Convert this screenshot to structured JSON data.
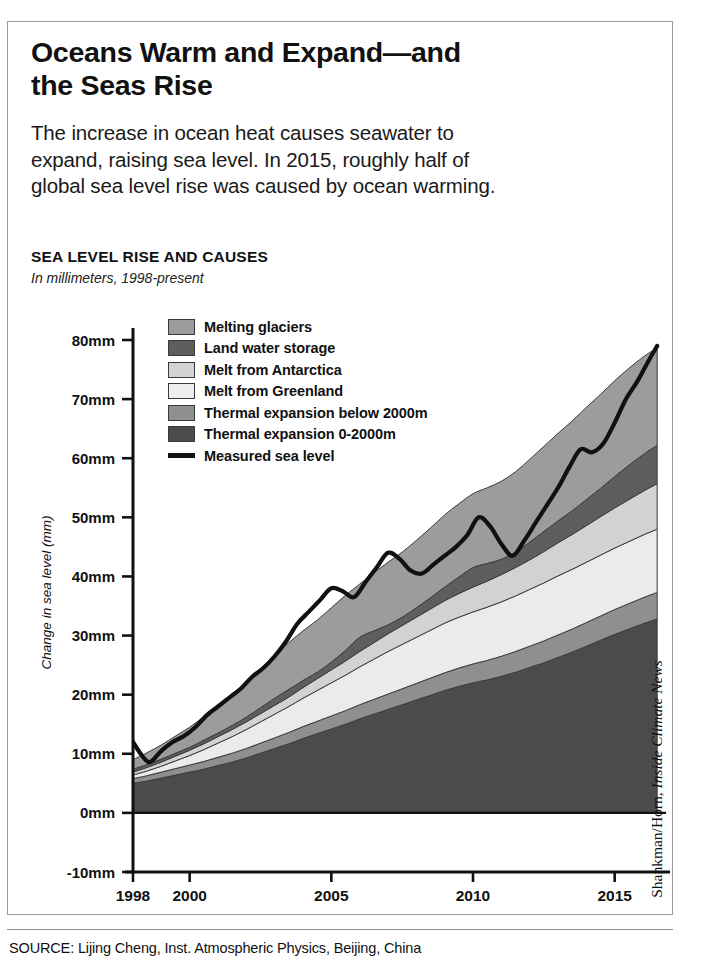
{
  "headline": "Oceans Warm and Expand—and the Seas Rise",
  "deck": "The increase in ocean heat causes seawater to expand, raising sea level. In 2015, roughly half of global sea level rise was caused by ocean warming.",
  "chart_kicker": "SEA LEVEL RISE AND CAUSES",
  "chart_subtitle": "In millimeters, 1998-present",
  "source": "SOURCE: Lijing Cheng, Inst. Atmospheric Physics, Beijing, China",
  "credit": "Shankman/Horn, ",
  "credit_italic": "Inside Climate News",
  "chart_data": {
    "type": "area",
    "title": "SEA LEVEL RISE AND CAUSES",
    "subtitle": "In millimeters, 1998-present",
    "xlabel": "",
    "ylabel": "Change in sea level (mm)",
    "ylim": [
      -10,
      85
    ],
    "xlim": [
      1998,
      2016.6
    ],
    "grid": false,
    "legend_position": "inside-top-left",
    "stacked": true,
    "y_ticks": [
      -10,
      0,
      10,
      20,
      30,
      40,
      50,
      60,
      70,
      80
    ],
    "y_tick_labels": [
      "-10mm",
      "0mm",
      "10mm",
      "20mm",
      "30mm",
      "40mm",
      "50mm",
      "60mm",
      "70mm",
      "80mm"
    ],
    "x_ticks": [
      1998,
      2000,
      2005,
      2010,
      2015
    ],
    "x_tick_labels": [
      "1998",
      "2000",
      "2005",
      "2010",
      "2015"
    ],
    "x": [
      1998.0,
      1998.5,
      1999.0,
      1999.5,
      2000.0,
      2000.5,
      2001.0,
      2001.5,
      2002.0,
      2002.5,
      2003.0,
      2003.5,
      2004.0,
      2004.5,
      2005.0,
      2005.5,
      2006.0,
      2006.5,
      2007.0,
      2007.5,
      2008.0,
      2008.5,
      2009.0,
      2009.5,
      2010.0,
      2010.5,
      2011.0,
      2011.5,
      2012.0,
      2012.5,
      2013.0,
      2013.5,
      2014.0,
      2014.5,
      2015.0,
      2015.5,
      2016.0,
      2016.5
    ],
    "series": [
      {
        "name": "Thermal expansion 0-2000m",
        "color": "#4b4b4b",
        "legend_color": "#4b4b4b",
        "values": [
          5.0,
          5.4,
          5.9,
          6.4,
          6.9,
          7.4,
          8.0,
          8.6,
          9.3,
          10.1,
          10.9,
          11.7,
          12.6,
          13.4,
          14.2,
          15.0,
          15.9,
          16.7,
          17.5,
          18.3,
          19.1,
          19.9,
          20.7,
          21.4,
          22.0,
          22.5,
          23.1,
          23.8,
          24.6,
          25.4,
          26.3,
          27.2,
          28.2,
          29.2,
          30.2,
          31.1,
          32.0,
          32.8
        ]
      },
      {
        "name": "Thermal expansion below 2000m",
        "color": "#8f8f8f",
        "legend_color": "#8f8f8f",
        "values": [
          0.8,
          0.9,
          1.0,
          1.1,
          1.2,
          1.3,
          1.4,
          1.5,
          1.6,
          1.7,
          1.8,
          1.9,
          2.0,
          2.1,
          2.2,
          2.3,
          2.4,
          2.5,
          2.6,
          2.7,
          2.8,
          2.9,
          3.0,
          3.1,
          3.2,
          3.3,
          3.4,
          3.5,
          3.6,
          3.7,
          3.8,
          3.9,
          4.0,
          4.1,
          4.2,
          4.3,
          4.4,
          4.5
        ]
      },
      {
        "name": "Melt from Greenland",
        "color": "#ebebeb",
        "legend_color": "#ededed",
        "values": [
          0.6,
          0.8,
          1.0,
          1.3,
          1.6,
          2.0,
          2.4,
          2.8,
          3.2,
          3.6,
          4.0,
          4.4,
          4.8,
          5.2,
          5.6,
          6.0,
          6.4,
          6.8,
          7.2,
          7.5,
          7.8,
          8.1,
          8.4,
          8.6,
          8.8,
          9.0,
          9.2,
          9.4,
          9.6,
          9.8,
          10.0,
          10.1,
          10.2,
          10.3,
          10.4,
          10.5,
          10.6,
          10.7
        ]
      },
      {
        "name": "Melt from Antarctica",
        "color": "#d2d2d2",
        "legend_color": "#d3d3d3",
        "values": [
          0.5,
          0.6,
          0.7,
          0.8,
          0.9,
          1.0,
          1.1,
          1.2,
          1.3,
          1.4,
          1.5,
          1.6,
          1.8,
          2.0,
          2.2,
          2.4,
          2.6,
          2.8,
          3.0,
          3.2,
          3.4,
          3.6,
          3.8,
          4.0,
          4.2,
          4.4,
          4.6,
          4.8,
          5.0,
          5.3,
          5.6,
          5.9,
          6.2,
          6.5,
          6.8,
          7.1,
          7.4,
          7.7
        ]
      },
      {
        "name": "Land water storage",
        "color": "#5e5e5e",
        "legend_color": "#5e5e5e",
        "values": [
          0.5,
          0.5,
          0.5,
          0.5,
          0.5,
          0.6,
          0.6,
          0.7,
          0.8,
          1.0,
          1.2,
          1.3,
          1.2,
          1.1,
          1.3,
          1.8,
          2.4,
          2.0,
          1.5,
          1.4,
          1.6,
          1.9,
          2.3,
          2.8,
          3.3,
          3.0,
          2.6,
          2.6,
          3.0,
          3.4,
          3.7,
          4.0,
          4.4,
          4.8,
          5.3,
          5.8,
          6.2,
          6.5
        ]
      },
      {
        "name": "Melting glaciers",
        "color": "#9c9c9c",
        "legend_color": "#9c9c9c",
        "values": [
          1.6,
          2.0,
          2.4,
          2.9,
          3.4,
          4.0,
          4.6,
          5.2,
          5.8,
          6.5,
          7.2,
          7.9,
          8.4,
          8.8,
          9.2,
          9.3,
          9.0,
          9.8,
          10.6,
          11.0,
          11.4,
          11.8,
          12.2,
          12.4,
          12.5,
          12.8,
          13.2,
          13.6,
          14.0,
          14.4,
          14.8,
          15.2,
          15.6,
          15.9,
          16.2,
          16.4,
          16.5,
          16.5
        ]
      }
    ],
    "line_series": {
      "name": "Measured sea level",
      "color": "#111111",
      "x": [
        1998.0,
        1998.3,
        1998.6,
        1999.0,
        1999.4,
        1999.8,
        2000.2,
        2000.6,
        2001.0,
        2001.4,
        2001.8,
        2002.2,
        2002.6,
        2003.0,
        2003.4,
        2003.8,
        2004.2,
        2004.6,
        2005.0,
        2005.4,
        2005.8,
        2006.2,
        2006.6,
        2007.0,
        2007.4,
        2007.8,
        2008.2,
        2008.6,
        2009.0,
        2009.4,
        2009.8,
        2010.2,
        2010.6,
        2011.0,
        2011.4,
        2011.8,
        2012.2,
        2012.6,
        2013.0,
        2013.4,
        2013.8,
        2014.2,
        2014.6,
        2015.0,
        2015.4,
        2015.8,
        2016.2,
        2016.5
      ],
      "values": [
        12.0,
        9.8,
        8.6,
        10.5,
        12.0,
        13.0,
        14.5,
        16.5,
        18.0,
        19.5,
        21.0,
        23.0,
        24.5,
        26.5,
        29.0,
        32.0,
        34.0,
        36.0,
        38.0,
        37.5,
        36.5,
        39.0,
        41.5,
        44.0,
        43.0,
        41.0,
        40.5,
        42.0,
        43.5,
        45.0,
        47.0,
        50.0,
        48.5,
        45.5,
        43.5,
        46.0,
        49.0,
        52.0,
        55.0,
        58.5,
        61.5,
        61.0,
        62.5,
        66.0,
        70.0,
        73.0,
        76.5,
        79.0
      ]
    }
  },
  "legend": [
    {
      "label": "Melting glaciers",
      "swatch": "#9c9c9c",
      "kind": "swatch"
    },
    {
      "label": "Land water storage",
      "swatch": "#5e5e5e",
      "kind": "swatch"
    },
    {
      "label": "Melt from Antarctica",
      "swatch": "#d3d3d3",
      "kind": "swatch"
    },
    {
      "label": "Melt from Greenland",
      "swatch": "#ededed",
      "kind": "swatch"
    },
    {
      "label": "Thermal expansion below 2000m",
      "swatch": "#8f8f8f",
      "kind": "swatch"
    },
    {
      "label": "Thermal expansion 0-2000m",
      "swatch": "#4b4b4b",
      "kind": "swatch"
    },
    {
      "label": "Measured sea level",
      "swatch": "#111111",
      "kind": "line"
    }
  ]
}
